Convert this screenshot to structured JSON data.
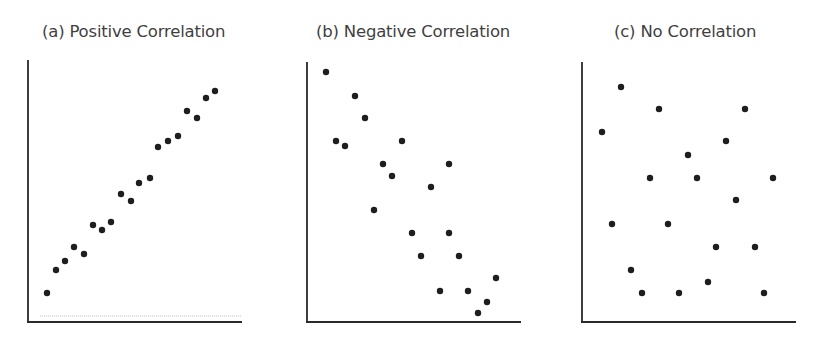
{
  "figure": {
    "background": "#ffffff",
    "axis_color": "#2a2a2a",
    "dot_color": "#1e1e1e",
    "title_color": "#3f3f3f"
  },
  "panels": [
    {
      "id": "a",
      "title": "(a) Positive Correlation",
      "title_x": 42,
      "axis": {
        "x0": 28,
        "y_top": 60,
        "y_bottom": 322,
        "x_right": 242
      },
      "baseline": {
        "y": 316,
        "x0": 40,
        "x1": 241
      }
    },
    {
      "id": "b",
      "title": "(b) Negative Correlation",
      "title_x": 316,
      "axis": {
        "x0": 307,
        "y_top": 62,
        "y_bottom": 322,
        "x_right": 521
      }
    },
    {
      "id": "c",
      "title": "(c) No Correlation",
      "title_x": 614,
      "axis": {
        "x0": 582,
        "y_top": 62,
        "y_bottom": 322,
        "x_right": 796
      }
    }
  ],
  "chart_data": [
    {
      "type": "scatter",
      "title": "(a) Positive Correlation",
      "xlabel": "",
      "ylabel": "",
      "grid": false,
      "note": "pixel coordinates (x right, y down) within the 815x337 figure; no axis ticks or labels",
      "points": [
        [
          47,
          293
        ],
        [
          56,
          270
        ],
        [
          65,
          261
        ],
        [
          74,
          247
        ],
        [
          84,
          254
        ],
        [
          93,
          225
        ],
        [
          102,
          230
        ],
        [
          111,
          222
        ],
        [
          121,
          194
        ],
        [
          131,
          201
        ],
        [
          139,
          183
        ],
        [
          150,
          178
        ],
        [
          158,
          147
        ],
        [
          168,
          141
        ],
        [
          178,
          136
        ],
        [
          187,
          111
        ],
        [
          197,
          118
        ],
        [
          206,
          98
        ],
        [
          215,
          91
        ]
      ]
    },
    {
      "type": "scatter",
      "title": "(b) Negative Correlation",
      "xlabel": "",
      "ylabel": "",
      "grid": false,
      "note": "pixel coordinates (x right, y down) within the 815x337 figure; no axis ticks or labels",
      "points": [
        [
          326,
          72
        ],
        [
          355,
          96
        ],
        [
          365,
          118
        ],
        [
          336,
          141
        ],
        [
          345,
          146
        ],
        [
          402,
          141
        ],
        [
          383,
          164
        ],
        [
          392,
          176
        ],
        [
          449,
          164
        ],
        [
          431,
          187
        ],
        [
          374,
          210
        ],
        [
          412,
          233
        ],
        [
          449,
          233
        ],
        [
          421,
          256
        ],
        [
          459,
          256
        ],
        [
          496,
          278
        ],
        [
          440,
          291
        ],
        [
          468,
          291
        ],
        [
          487,
          302
        ],
        [
          478,
          313
        ]
      ]
    },
    {
      "type": "scatter",
      "title": "(c) No Correlation",
      "xlabel": "",
      "ylabel": "",
      "grid": false,
      "note": "pixel coordinates (x right, y down) within the 815x337 figure; no axis ticks or labels",
      "points": [
        [
          621,
          87
        ],
        [
          659,
          109
        ],
        [
          745,
          109
        ],
        [
          602,
          132
        ],
        [
          726,
          141
        ],
        [
          688,
          155
        ],
        [
          650,
          178
        ],
        [
          697,
          178
        ],
        [
          773,
          178
        ],
        [
          736,
          200
        ],
        [
          612,
          224
        ],
        [
          668,
          224
        ],
        [
          716,
          247
        ],
        [
          755,
          247
        ],
        [
          631,
          270
        ],
        [
          708,
          282
        ],
        [
          642,
          293
        ],
        [
          679,
          293
        ],
        [
          764,
          293
        ]
      ]
    }
  ]
}
